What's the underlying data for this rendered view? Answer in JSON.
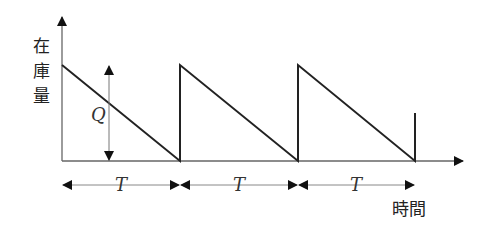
{
  "diagram": {
    "type": "sawtooth-inventory-model",
    "y_axis_label": [
      "在",
      "庫",
      "量"
    ],
    "x_axis_label": "時間",
    "quantity_label": "Q",
    "period_label": "T",
    "periods": [
      {
        "label": "T"
      },
      {
        "label": "T"
      },
      {
        "label": "T"
      }
    ],
    "colors": {
      "line": "#222222",
      "axis": "#555555",
      "background": "#ffffff"
    }
  }
}
